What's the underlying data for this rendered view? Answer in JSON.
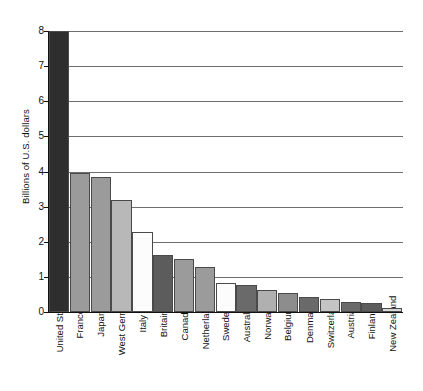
{
  "chart_data": {
    "type": "bar",
    "title": "",
    "subtitle": "",
    "xlabel": "",
    "ylabel": "Billions of U.S. dollars",
    "ylim": [
      0,
      8
    ],
    "ytick_labels": [
      "8",
      "7",
      "6",
      "5",
      "4",
      "3",
      "2",
      "1",
      "0"
    ],
    "ytick_values": [
      8,
      7,
      6,
      5,
      4,
      3,
      2,
      1,
      0
    ],
    "grid": true,
    "legend": "none",
    "categories": [
      "United States",
      "France",
      "Japan",
      "West Germany",
      "Italy",
      "Britain",
      "Canada",
      "Netherlands",
      "Sweden",
      "Australia",
      "Norway",
      "Belgium",
      "Denmark",
      "Switzerland",
      "Austria",
      "Finland",
      "New Zealand"
    ],
    "values": [
      8.0,
      3.95,
      3.85,
      3.2,
      2.28,
      1.62,
      1.5,
      1.28,
      0.82,
      0.77,
      0.63,
      0.54,
      0.43,
      0.37,
      0.28,
      0.26,
      0.11
    ],
    "bar_colors": [
      "#2e2e2e",
      "#9b9b9b",
      "#9b9b9b",
      "#b8b8b8",
      "#fcfcfc",
      "#5c5c5c",
      "#9b9b9b",
      "#9b9b9b",
      "#fcfcfc",
      "#6a6a6a",
      "#b0b0b0",
      "#8d8d8d",
      "#6a6a6a",
      "#c4c4c4",
      "#6a6a6a",
      "#5c5c5c",
      "#d8d8d8"
    ],
    "bar_edge_color": "#4a4a4a",
    "gridline_color": "#6f6f6f",
    "axis_color": "#111111"
  }
}
